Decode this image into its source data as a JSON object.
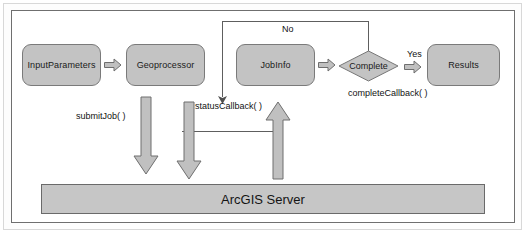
{
  "diagram": {
    "nodes": {
      "input_parameters": "InputParameters",
      "geoprocessor": "Geoprocessor",
      "job_info": "JobInfo",
      "complete": "Complete",
      "results": "Results",
      "server": "ArcGIS Server"
    },
    "edge_labels": {
      "no": "No",
      "yes": "Yes",
      "submit_job": "submitJob( )",
      "status_callback": "statusCallback( )",
      "complete_callback": "completeCallback( )"
    },
    "colors": {
      "node_fill": "#c3c3c3",
      "node_stroke": "#7a7a7a",
      "arrow_fill": "#c0c0c0",
      "arrow_stroke": "#737373",
      "line": "#5e5e5e",
      "server_fill": "#c6c6c6",
      "text": "#121212",
      "background": "#ffffff"
    }
  }
}
